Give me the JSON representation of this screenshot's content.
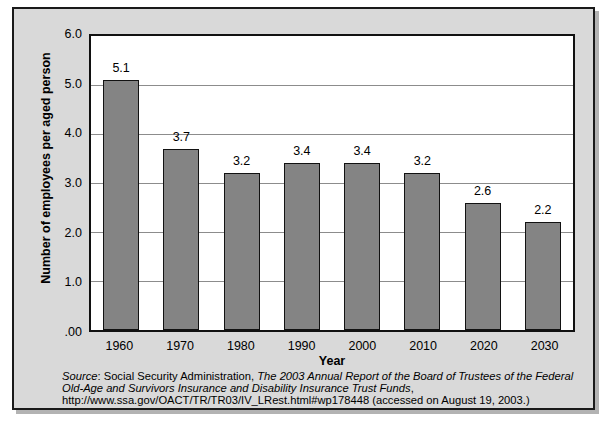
{
  "chart_data": {
    "type": "bar",
    "title": "",
    "subtitle": "",
    "categories": [
      "1960",
      "1970",
      "1980",
      "1990",
      "2000",
      "2010",
      "2020",
      "2030"
    ],
    "values": [
      5.1,
      3.7,
      3.2,
      3.4,
      3.4,
      3.2,
      2.6,
      2.2
    ],
    "data_labels": [
      "5.1",
      "3.7",
      "3.2",
      "3.4",
      "3.4",
      "3.2",
      "2.6",
      "2.2"
    ],
    "xlabel": "Year",
    "ylabel": "Number of employees per aged person",
    "ylim": [
      0,
      6
    ],
    "ytick_values": [
      0,
      1,
      2,
      3,
      4,
      5,
      6
    ],
    "ytick_labels": [
      ".00",
      "1.0",
      "2.0",
      "3.0",
      "4.0",
      "5.0",
      "6.0"
    ],
    "grid": true,
    "grid_axis": "y",
    "legend": false,
    "legend_position": "none",
    "bar_color": "#848484",
    "bar_edge_color": "#121212",
    "plot_background": "#ffffff",
    "figure_background": "#d9d9d9",
    "frame_color": "#1a1a1a"
  },
  "source": {
    "label": "Source",
    "line1_pre": ": Social Security Administration, ",
    "line1_italic": "The 2003 Annual Report of the Board of Trustees of the Federal Old-Age and Survivors Insurance and Disability Insurance Trust Funds",
    "line1_post": ", http://www.ssa.gov/OACT/TR/TR03/IV_LRest.html#wp178448 (accessed on August 19, 2003.)"
  }
}
